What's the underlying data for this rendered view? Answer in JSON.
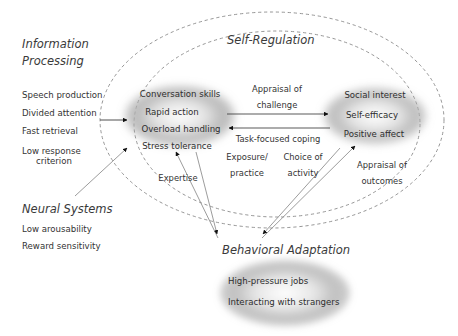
{
  "diagram": {
    "title_regions": {
      "information_processing": "Information\nProcessing",
      "information_processing_line1": "Information",
      "information_processing_line2": "Processing",
      "neural_systems": "Neural Systems",
      "self_regulation": "Self-Regulation",
      "behavioral_adaptation": "Behavioral Adaptation"
    },
    "information_processing_items": [
      "Speech production",
      "Divided attention",
      "Fast retrieval",
      "Low response",
      "criterion"
    ],
    "neural_systems_items": [
      "Low arousability",
      "Reward sensitivity"
    ],
    "skills_ellipse_items": [
      "Conversation skills",
      "Rapid action",
      "Overload handling",
      "Stress tolerance"
    ],
    "motivation_ellipse_items": [
      "Social interest",
      "Self-efficacy",
      "Positive affect"
    ],
    "behavior_ellipse_items": [
      "High-pressure jobs",
      "Interacting with strangers"
    ],
    "arrow_labels": {
      "appraisal_of_challenge_line1": "Appraisal of",
      "appraisal_of_challenge_line2": "challenge",
      "task_focused_coping": "Task-focused coping",
      "exposure_practice_line1": "Exposure/",
      "exposure_practice_line2": "practice",
      "choice_of_activity_line1": "Choice of",
      "choice_of_activity_line2": "activity",
      "appraisal_of_outcomes_line1": "Appraisal of",
      "appraisal_of_outcomes_line2": "outcomes",
      "expertise": "Expertise"
    },
    "colors": {
      "text": "#333333",
      "heading": "#3a3a3a",
      "stroke": "#6e6e6e",
      "arrow": "#1a1a1a",
      "ellipse_fill": "#9a9a9a",
      "background": "#ffffff"
    }
  }
}
